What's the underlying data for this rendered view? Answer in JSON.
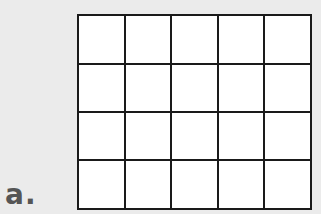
{
  "figure": {
    "label": "a.",
    "grid": {
      "rows": 4,
      "columns": 5,
      "cell_fill": "#ffffff",
      "line_color": "#1a1a1a"
    },
    "background": "#ebebeb"
  }
}
